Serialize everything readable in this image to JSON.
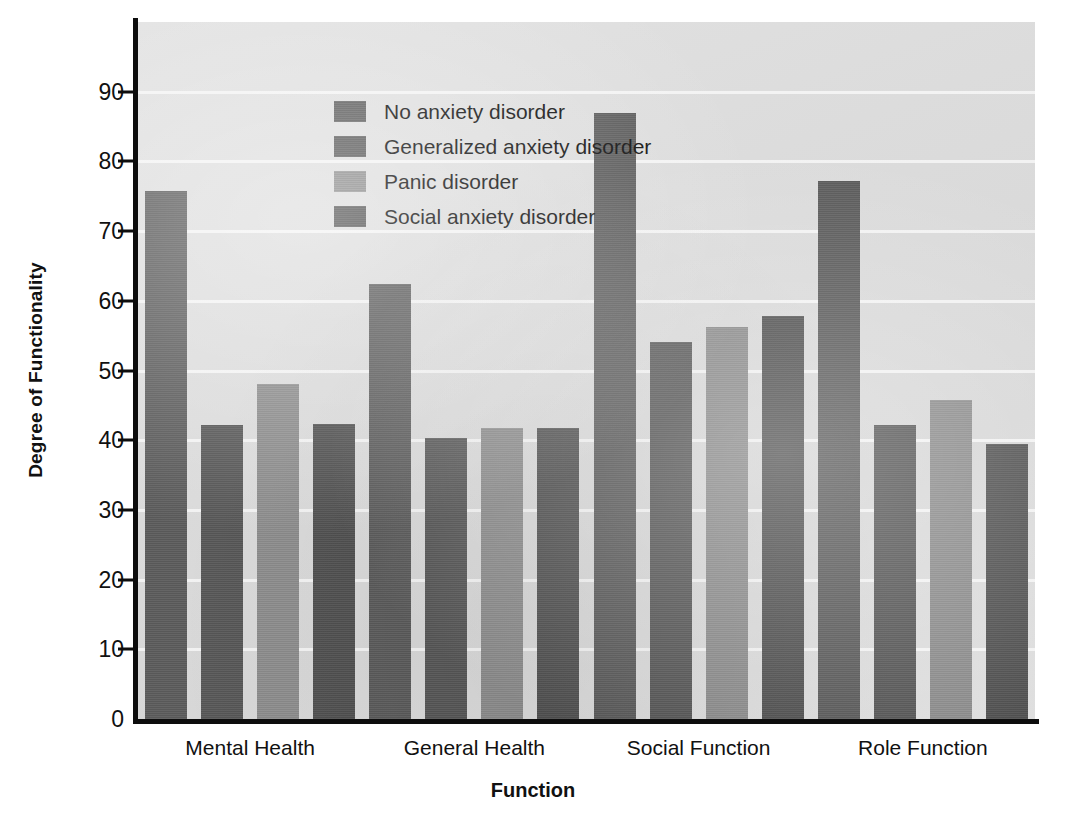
{
  "chart_data": {
    "type": "bar",
    "title": "",
    "xlabel": "Function",
    "ylabel": "Degree of Functionality",
    "categories": [
      "Mental Health",
      "General Health",
      "Social Function",
      "Role Function"
    ],
    "series": [
      {
        "name": "No anxiety disorder",
        "color": "#5c5c5c",
        "values": [
          75.8,
          62.4,
          87.0,
          77.2
        ]
      },
      {
        "name": "Generalized anxiety disorder",
        "color": "#585858",
        "values": [
          42.2,
          40.3,
          54.1,
          42.2
        ]
      },
      {
        "name": "Panic disorder",
        "color": "#8e8e8e",
        "values": [
          48.0,
          41.7,
          56.3,
          45.7
        ]
      },
      {
        "name": "Social anxiety disorder",
        "color": "#525252",
        "values": [
          42.3,
          41.8,
          57.8,
          39.4
        ]
      }
    ],
    "ylim": [
      0,
      100
    ],
    "ytick_labels": [
      "0",
      "10",
      "20",
      "30",
      "40",
      "50",
      "60",
      "70",
      "80",
      "90"
    ],
    "ytick_values": [
      0,
      10,
      20,
      30,
      40,
      50,
      60,
      70,
      80,
      90
    ],
    "grid": true,
    "legend_position": "upper-left-inside",
    "plot_background": "#dcdcdc",
    "gridline_color": "#f4f4f4",
    "axis_color": "#0d0d0d"
  }
}
